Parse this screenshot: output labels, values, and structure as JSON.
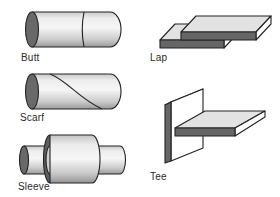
{
  "joints": {
    "items": [
      {
        "id": "butt",
        "label": "Butt",
        "shape": "cylinder-with-straight-seam"
      },
      {
        "id": "lap",
        "label": "Lap",
        "shape": "two-overlapping-flat-plates"
      },
      {
        "id": "scarf",
        "label": "Scarf",
        "shape": "cylinder-with-diagonal-seam"
      },
      {
        "id": "sleeve",
        "label": "Sleeve",
        "shape": "pipe-with-outer-sleeve-collar"
      },
      {
        "id": "tee",
        "label": "Tee",
        "shape": "vertical-plate-with-perpendicular-horizontal-plate"
      }
    ],
    "colors": {
      "outline": "#222222",
      "end_face_dark": "#696969",
      "plate_front_dark": "#666666",
      "plate_top_light": "#e2e2e2",
      "side_face_white": "#ffffff",
      "label_text": "#2b2b2b",
      "background": "#ffffff"
    }
  }
}
